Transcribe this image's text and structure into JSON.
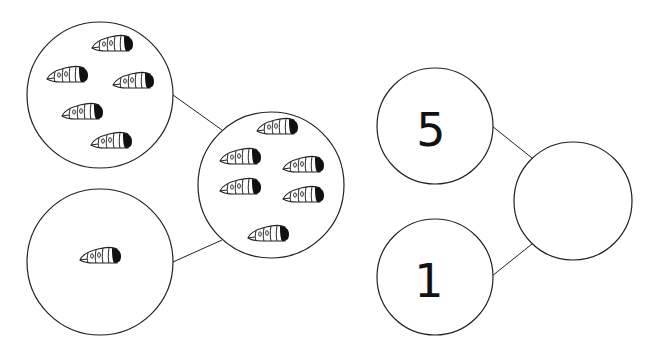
{
  "worksheet": {
    "type": "number-bond",
    "colors": {
      "stroke": "#222222",
      "fill": "#ffffff",
      "worm_head": "#111111"
    },
    "picture_bond": {
      "part_a": {
        "label": "part-a-circle",
        "worm_count": 5,
        "worms": [
          [
            112,
            45
          ],
          [
            67,
            76
          ],
          [
            133,
            82
          ],
          [
            82,
            113
          ],
          [
            111,
            142
          ]
        ]
      },
      "part_b": {
        "label": "part-b-circle",
        "worm_count": 1,
        "worms": [
          [
            100,
            257
          ]
        ]
      },
      "whole": {
        "label": "whole-circle",
        "worm_count": 6,
        "worms": [
          [
            277,
            128
          ],
          [
            240,
            158
          ],
          [
            303,
            166
          ],
          [
            240,
            188
          ],
          [
            303,
            196
          ],
          [
            268,
            235
          ]
        ]
      }
    },
    "number_bond": {
      "part_a": {
        "value": "5"
      },
      "part_b": {
        "value": "1"
      },
      "whole": {
        "value": ""
      }
    }
  }
}
